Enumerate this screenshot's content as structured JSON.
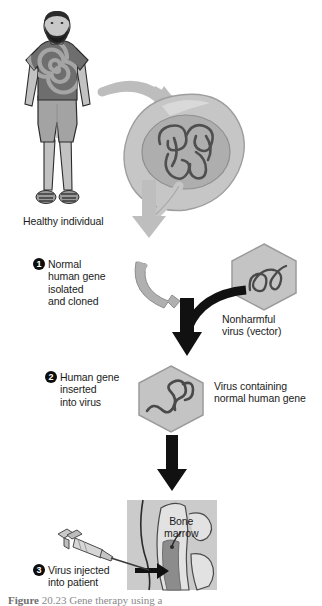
{
  "figure": {
    "background_color": "#ffffff"
  },
  "labels": {
    "healthy_individual": "Healthy individual",
    "nonharmful_virus": "Nonharmful\nvirus (vector)",
    "virus_containing": "Virus containing\nnormal human gene",
    "bone_marrow": "Bone\nmarrow"
  },
  "steps": [
    {
      "number": "1",
      "text": "Normal\nhuman gene\nisolated\nand cloned"
    },
    {
      "number": "2",
      "text": "Human gene\ninserted\ninto virus"
    },
    {
      "number": "3",
      "text": "Virus injected\ninto patient"
    }
  ],
  "caption": {
    "prefix": "Figure",
    "number": "20.23",
    "text": "Gene therapy using a"
  },
  "colors": {
    "text": "#1b1b1b",
    "bullet_fill": "#0d0d0d",
    "bullet_text": "#ffffff",
    "arrow_gray": "#b4b4b4",
    "arrow_black": "#111111",
    "cell_membrane": "#bdbdbd",
    "cell_cytoplasm": "#c9c9c9",
    "nucleus": "#a8a8a8",
    "dna_strand": "#4a4a4a",
    "hexagon_fill": "#c4c4c4",
    "hexagon_stroke": "#9b9b9b",
    "shirt": "#6e6e6e",
    "shirt_spiral": "#9a9a9a",
    "shorts": "#a3a3a3",
    "skin": "#bdbdbd",
    "hair": "#2b2b2b",
    "panel_bg": "#cfcfcf",
    "marrow": "#8c8c8c"
  },
  "icons": {
    "person": "healthy-person-icon",
    "cell": "cell-with-nucleus-icon",
    "gene_fragment": "isolated-gene-icon",
    "virus_empty": "virus-hexagon-icon",
    "virus_loaded": "virus-with-gene-hexagon-icon",
    "syringe": "syringe-icon",
    "bone": "bone-marrow-icon",
    "arrow_curved_gray": "curved-gray-arrow-icon",
    "arrow_curved_black": "curved-black-arrow-icon",
    "arrow_down_black": "down-black-arrow-icon",
    "arrow_inject": "injection-arrow-icon"
  }
}
